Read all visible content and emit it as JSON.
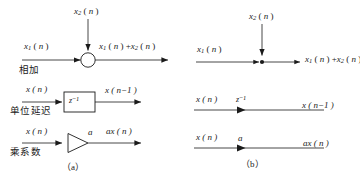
{
  "figure": {
    "stroke_color": "#1a1a1a",
    "background_color": "#ffffff"
  },
  "panel_a": {
    "caption": "（a）",
    "rows": [
      {
        "name": "adder",
        "cn_label": "相加",
        "input_main": "x₁ ( n )",
        "input_top": "x₂ ( n )",
        "output": "x₁ ( n ) +x₂ ( n )",
        "operator_shape": "circle"
      },
      {
        "name": "unit-delay",
        "cn_label": "单位延迟",
        "input_main": "x ( n )",
        "output": "x ( n−1 )",
        "block_label": "z⁻¹",
        "operator_shape": "rectangle"
      },
      {
        "name": "coefficient-multiplier",
        "cn_label": "乘系数",
        "input_main": "x ( n )",
        "output": "ax ( n )",
        "gain_label": "a",
        "operator_shape": "triangle"
      }
    ]
  },
  "panel_b": {
    "caption": "（b）",
    "rows": [
      {
        "name": "adder-node",
        "input_main": "x₁ ( n )",
        "input_top": "x₂ ( n )",
        "output": "x₁ ( n ) +x₂ ( n )",
        "operator_shape": "node-dot"
      },
      {
        "name": "unit-delay-branch",
        "input_main": "x ( n )",
        "output": "x ( n−1 )",
        "branch_label": "z⁻¹",
        "operator_shape": "directed-branch"
      },
      {
        "name": "gain-branch",
        "input_main": "x ( n )",
        "output": "ax ( n )",
        "branch_label": "a",
        "operator_shape": "directed-branch"
      }
    ]
  }
}
